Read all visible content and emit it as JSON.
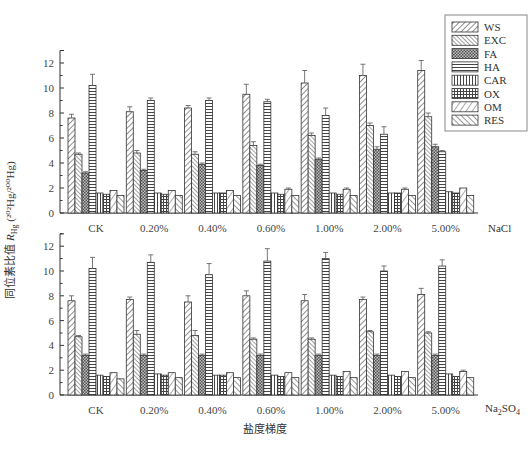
{
  "chart_data": [
    {
      "type": "bar",
      "panel": "top",
      "salt": "NaCl",
      "categories": [
        "CK",
        "0.20%",
        "0.40%",
        "0.60%",
        "1.00%",
        "2.00%",
        "5.00%"
      ],
      "series": [
        {
          "name": "WS",
          "values": [
            7.6,
            8.1,
            8.4,
            9.5,
            10.4,
            11.0,
            11.4
          ],
          "errors": [
            0.3,
            0.4,
            0.2,
            0.8,
            1.0,
            0.9,
            0.8
          ]
        },
        {
          "name": "EXC",
          "values": [
            4.7,
            4.8,
            4.7,
            5.4,
            6.2,
            7.0,
            7.7
          ],
          "errors": [
            0.1,
            0.2,
            0.2,
            0.3,
            0.2,
            0.2,
            0.3
          ]
        },
        {
          "name": "FA",
          "values": [
            3.2,
            3.4,
            3.9,
            3.8,
            4.3,
            5.1,
            5.3
          ],
          "errors": [
            0.1,
            0.1,
            0.1,
            0.1,
            0.1,
            0.2,
            0.2
          ]
        },
        {
          "name": "HA",
          "values": [
            10.2,
            9.0,
            9.0,
            8.9,
            7.8,
            6.3,
            4.9
          ],
          "errors": [
            0.9,
            0.2,
            0.2,
            0.2,
            0.6,
            0.6,
            0.1
          ]
        },
        {
          "name": "CAR",
          "values": [
            1.6,
            1.6,
            1.6,
            1.6,
            1.6,
            1.6,
            1.7
          ],
          "errors": [
            0.05,
            0.05,
            0.05,
            0.05,
            0.05,
            0.05,
            0.05
          ]
        },
        {
          "name": "OX",
          "values": [
            1.5,
            1.5,
            1.6,
            1.5,
            1.5,
            1.6,
            1.6
          ],
          "errors": [
            0.05,
            0.05,
            0.05,
            0.05,
            0.05,
            0.05,
            0.05
          ]
        },
        {
          "name": "OM",
          "values": [
            1.8,
            1.8,
            1.8,
            1.9,
            1.9,
            1.9,
            2.0
          ],
          "errors": [
            0.05,
            0.05,
            0.05,
            0.1,
            0.1,
            0.1,
            0.05
          ]
        },
        {
          "name": "RES",
          "values": [
            1.4,
            1.4,
            1.4,
            1.4,
            1.4,
            1.4,
            1.4
          ],
          "errors": [
            0.05,
            0.05,
            0.05,
            0.05,
            0.05,
            0.05,
            0.05
          ]
        }
      ],
      "ylim": [
        0,
        13
      ],
      "yticks": [
        0,
        2,
        4,
        6,
        8,
        10,
        12
      ]
    },
    {
      "type": "bar",
      "panel": "bottom",
      "salt": "Na2SO4",
      "categories": [
        "CK",
        "0.20%",
        "0.40%",
        "0.60%",
        "1.00%",
        "2.00%",
        "5.00%"
      ],
      "series": [
        {
          "name": "WS",
          "values": [
            7.6,
            7.7,
            7.5,
            8.0,
            7.6,
            7.7,
            8.1
          ],
          "errors": [
            0.4,
            0.2,
            0.5,
            0.4,
            0.5,
            0.2,
            0.5
          ]
        },
        {
          "name": "EXC",
          "values": [
            4.7,
            4.9,
            4.8,
            4.5,
            4.5,
            5.1,
            5.0
          ],
          "errors": [
            0.1,
            0.3,
            0.4,
            0.1,
            0.1,
            0.1,
            0.1
          ]
        },
        {
          "name": "FA",
          "values": [
            3.2,
            3.2,
            3.2,
            3.2,
            3.2,
            3.2,
            3.2
          ],
          "errors": [
            0.1,
            0.1,
            0.1,
            0.1,
            0.1,
            0.1,
            0.1
          ]
        },
        {
          "name": "HA",
          "values": [
            10.2,
            10.7,
            9.7,
            10.8,
            11.0,
            10.0,
            10.4
          ],
          "errors": [
            0.9,
            0.6,
            0.9,
            1.0,
            0.5,
            0.4,
            0.5
          ]
        },
        {
          "name": "CAR",
          "values": [
            1.6,
            1.7,
            1.6,
            1.6,
            1.6,
            1.6,
            1.7
          ],
          "errors": [
            0.05,
            0.05,
            0.05,
            0.05,
            0.05,
            0.05,
            0.05
          ]
        },
        {
          "name": "OX",
          "values": [
            1.5,
            1.6,
            1.6,
            1.5,
            1.5,
            1.5,
            1.5
          ],
          "errors": [
            0.05,
            0.05,
            0.05,
            0.05,
            0.05,
            0.05,
            0.05
          ]
        },
        {
          "name": "OM",
          "values": [
            1.8,
            1.8,
            1.8,
            1.8,
            1.9,
            1.9,
            1.9
          ],
          "errors": [
            0.05,
            0.05,
            0.05,
            0.05,
            0.05,
            0.05,
            0.1
          ]
        },
        {
          "name": "RES",
          "values": [
            1.3,
            1.4,
            1.4,
            1.4,
            1.4,
            1.4,
            1.4
          ],
          "errors": [
            0.05,
            0.05,
            0.05,
            0.05,
            0.05,
            0.05,
            0.05
          ]
        }
      ],
      "ylim": [
        0,
        13
      ],
      "yticks": [
        0,
        2,
        4,
        6,
        8,
        10,
        12
      ]
    }
  ],
  "labels": {
    "ylabel": "同位素比值 R_Hg (²⁰²Hg/²⁰⁰Hg)",
    "ylabel_main": "同位素比值 ",
    "ylabel_r": "R",
    "ylabel_sub": "Hg",
    "ylabel_ratio": " (²⁰²Hg/²⁰⁰Hg)",
    "xlabel": "盐度梯度",
    "top_salt": "NaCl",
    "bottom_salt_main": "Na",
    "bottom_salt_sub1": "2",
    "bottom_salt_mid": "SO",
    "bottom_salt_sub2": "4"
  },
  "legend": {
    "items": [
      "WS",
      "EXC",
      "FA",
      "HA",
      "CAR",
      "OX",
      "OM",
      "RES"
    ]
  }
}
